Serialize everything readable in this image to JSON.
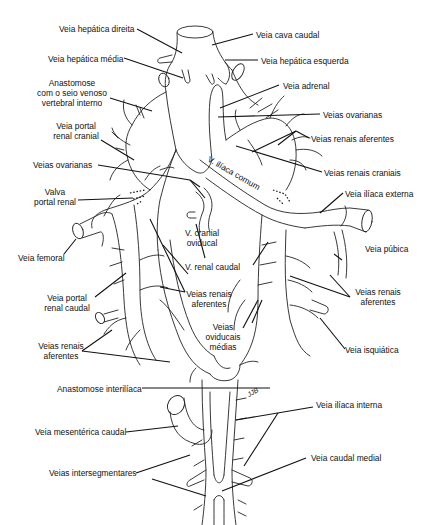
{
  "diagram": {
    "labels": {
      "veia_hepatica_direita": "Veia hepática direita",
      "veia_cava_caudal": "Veia cava caudal",
      "veia_hepatica_media": "Veia hepática média",
      "veia_hepatica_esquerda": "Veia hepática esquerda",
      "anastomose_seio_l1": "Anastomose",
      "anastomose_seio_l2": "com o seio venoso",
      "anastomose_seio_l3": "vertebral interno",
      "veia_adrenal": "Veia adrenal",
      "veias_ovarianas_right": "Veias ovarianas",
      "veia_portal_renal_cranial_l1": "Veia portal",
      "veia_portal_renal_cranial_l2": "renal cranial",
      "veias_renais_aferentes_top": "Veias renais aferentes",
      "veias_ovarianas_left": "Veias ovarianas",
      "veias_renais_craniais": "Veias renais craniais",
      "v_iliaca_comum": "V. ilíaca comum",
      "valva_portal_renal_l1": "Valva",
      "valva_portal_renal_l2": "portal renal",
      "veia_iliaca_externa": "Veia ilíaca externa",
      "veia_femoral": "Veia femoral",
      "v_cranial_oviducal_l1": "V. cranial",
      "v_cranial_oviducal_l2": "oviducal",
      "veia_pubica": "Veia púbica",
      "v_renal_caudal": "V. renal  caudal",
      "veia_portal_renal_caudal_l1": "Veia portal",
      "veia_portal_renal_caudal_l2": "renal caudal",
      "veias_renais_aferentes_mid_l1": "Veias renais",
      "veias_renais_aferentes_mid_l2": "aferentes",
      "veias_renais_aferentes_right_l1": "Veias renais",
      "veias_renais_aferentes_right_l2": "aferentes",
      "veias_oviducais_medias_l1": "Veias",
      "veias_oviducais_medias_l2": "oviducais",
      "veias_oviducais_medias_l3": "médias",
      "veias_renais_aferentes_low_l1": "Veias renais",
      "veias_renais_aferentes_low_l2": "aferentes",
      "veia_isquiatica": "Veia isquiática",
      "anastomose_interiliaca": "Anastomose interilíaca",
      "veia_iliaca_interna": "Veia ilíaca interna",
      "veia_mesenterica_caudal": "Veia mesentérica caudal",
      "veia_caudal_medial": "Veia caudal medial",
      "veias_intersegmentares": "Veias intersegmentares",
      "artist_signature": "JJB"
    }
  }
}
